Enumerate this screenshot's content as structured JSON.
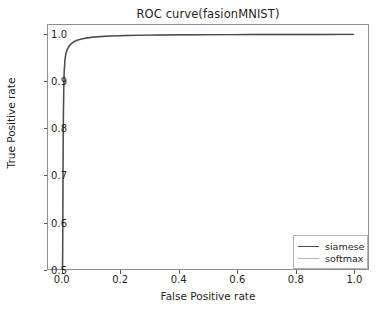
{
  "chart_data": {
    "type": "line",
    "title": "ROC curve(fasionMNIST)",
    "xlabel": "False Positive rate",
    "ylabel": "True Positive rate",
    "xlim": [
      -0.05,
      1.05
    ],
    "ylim": [
      0.5,
      1.02
    ],
    "grid": false,
    "legend_position": "lower right",
    "xticks": [
      "0.0",
      "0.2",
      "0.4",
      "0.6",
      "0.8",
      "1.0"
    ],
    "xtick_values": [
      0.0,
      0.2,
      0.4,
      0.6,
      0.8,
      1.0
    ],
    "yticks": [
      "0.5",
      "0.6",
      "0.7",
      "0.8",
      "0.9",
      "1.0"
    ],
    "ytick_values": [
      0.5,
      0.6,
      0.7,
      0.8,
      0.9,
      1.0
    ],
    "series": [
      {
        "name": "siamese",
        "color": "#4d4d4d",
        "x": [
          0.0,
          0.001,
          0.002,
          0.003,
          0.004,
          0.006,
          0.008,
          0.011,
          0.015,
          0.02,
          0.026,
          0.033,
          0.042,
          0.053,
          0.066,
          0.082,
          0.1,
          0.12,
          0.145,
          0.175,
          0.21,
          0.25,
          0.3,
          0.35,
          0.4,
          0.45,
          0.5,
          0.55,
          0.6,
          0.65,
          0.7,
          0.75,
          0.8,
          0.85,
          0.9,
          0.95,
          1.0
        ],
        "y": [
          0.5,
          0.62,
          0.74,
          0.83,
          0.885,
          0.925,
          0.945,
          0.958,
          0.967,
          0.973,
          0.978,
          0.982,
          0.9855,
          0.9882,
          0.9905,
          0.9923,
          0.9938,
          0.995,
          0.996,
          0.9968,
          0.9975,
          0.998,
          0.9985,
          0.9988,
          0.9991,
          0.9993,
          0.9994,
          0.9995,
          0.9996,
          0.9997,
          0.9997,
          0.9998,
          0.9998,
          0.9999,
          0.9999,
          1.0,
          1.0
        ]
      },
      {
        "name": "softmax",
        "color": "#a9a9a9",
        "x": [
          0.0,
          0.001,
          0.002,
          0.003,
          0.004,
          0.006,
          0.008,
          0.011,
          0.015,
          0.02,
          0.026,
          0.033,
          0.042,
          0.053,
          0.066,
          0.082,
          0.1,
          0.12,
          0.145,
          0.175,
          0.21,
          0.25,
          0.3,
          0.35,
          0.4,
          0.45,
          0.5,
          0.55,
          0.6,
          0.65,
          0.7,
          0.75,
          0.8,
          0.85,
          0.9,
          0.95,
          1.0
        ],
        "y": [
          0.5,
          0.6,
          0.72,
          0.815,
          0.875,
          0.918,
          0.94,
          0.954,
          0.964,
          0.971,
          0.9765,
          0.9808,
          0.9845,
          0.9875,
          0.99,
          0.9919,
          0.9934,
          0.9947,
          0.9957,
          0.9966,
          0.9973,
          0.9979,
          0.9984,
          0.9987,
          0.999,
          0.9992,
          0.9994,
          0.9995,
          0.9996,
          0.9996,
          0.9997,
          0.9998,
          0.9998,
          0.9999,
          0.9999,
          1.0,
          1.0
        ]
      }
    ]
  },
  "legend": {
    "items": [
      {
        "label": "siamese",
        "color": "#4d4d4d"
      },
      {
        "label": "softmax",
        "color": "#b5b5b5"
      }
    ]
  },
  "colors": {
    "axis": "#8f8f8f",
    "text": "#1f1f1f",
    "background": "#ffffff",
    "siamese": "#4d4d4d",
    "softmax": "#b5b5b5"
  }
}
